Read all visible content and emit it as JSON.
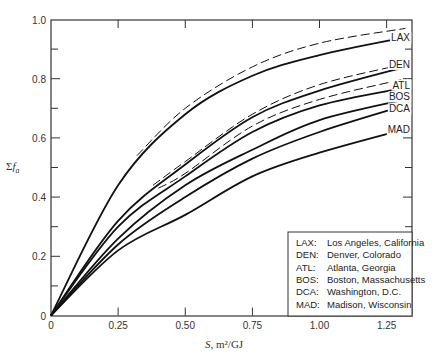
{
  "chart_data": {
    "type": "line",
    "title": "",
    "xlabel": "S, m²/GJ",
    "ylabel": "Σf_a",
    "xlim": [
      0,
      1.37
    ],
    "ylim": [
      0,
      1.0
    ],
    "grid": false,
    "x_ticks": [
      "0",
      "0.25",
      "0.50",
      "0.75",
      "1.00",
      "1.25"
    ],
    "x_tick_values": [
      0,
      0.25,
      0.5,
      0.75,
      1.0,
      1.25
    ],
    "y_ticks": [
      "0",
      "0.2",
      "0.4",
      "0.6",
      "0.8",
      "1.0"
    ],
    "y_tick_values": [
      0,
      0.2,
      0.4,
      0.6,
      0.8,
      1.0
    ],
    "x": [
      0,
      0.25,
      0.5,
      0.75,
      1.0,
      1.32
    ],
    "series": [
      {
        "name": "LAX",
        "style": "solid",
        "values": [
          0,
          0.44,
          0.68,
          0.81,
          0.88,
          0.94
        ]
      },
      {
        "name": "LAX (dashed)",
        "style": "dashed",
        "x": [
          0.32,
          0.5,
          0.75,
          1.0,
          1.32
        ],
        "values": [
          0.54,
          0.7,
          0.84,
          0.92,
          0.97
        ]
      },
      {
        "name": "DEN",
        "style": "solid",
        "values": [
          0,
          0.32,
          0.51,
          0.67,
          0.76,
          0.84
        ]
      },
      {
        "name": "DEN (dashed)",
        "style": "dashed",
        "x": [
          0.38,
          0.5,
          0.75,
          1.0,
          1.32
        ],
        "values": [
          0.44,
          0.52,
          0.68,
          0.78,
          0.85
        ]
      },
      {
        "name": "ATL",
        "style": "solid",
        "values": [
          0,
          0.3,
          0.47,
          0.62,
          0.71,
          0.77
        ]
      },
      {
        "name": "ATL (dashed)",
        "style": "dashed",
        "x": [
          0.4,
          0.5,
          0.75,
          1.0,
          1.32
        ],
        "values": [
          0.43,
          0.48,
          0.64,
          0.73,
          0.8
        ]
      },
      {
        "name": "BOS",
        "style": "solid",
        "values": [
          0,
          0.26,
          0.44,
          0.56,
          0.66,
          0.73
        ]
      },
      {
        "name": "DCA",
        "style": "solid",
        "values": [
          0,
          0.24,
          0.4,
          0.53,
          0.62,
          0.71
        ]
      },
      {
        "name": "MAD",
        "style": "solid",
        "values": [
          0,
          0.22,
          0.34,
          0.47,
          0.55,
          0.63
        ]
      }
    ],
    "curve_end_labels": [
      "LAX",
      "DEN",
      "ATL",
      "BOS",
      "DCA",
      "MAD"
    ],
    "legend": {
      "position": "lower right",
      "entries": [
        {
          "code": "LAX:",
          "name": "Los Angeles, California"
        },
        {
          "code": "DEN:",
          "name": "Denver, Colorado"
        },
        {
          "code": "ATL:",
          "name": "Atlanta, Georgia"
        },
        {
          "code": "BOS:",
          "name": "Boston, Massachusetts"
        },
        {
          "code": "DCA:",
          "name": "Washington, D.C."
        },
        {
          "code": "MAD:",
          "name": "Madison, Wisconsin"
        }
      ]
    }
  },
  "axes": {
    "x_label_var": "S",
    "x_label_units": ", m²/GJ",
    "y_label_sigma": "Σ",
    "y_label_var": "f",
    "y_label_sub": "a"
  }
}
